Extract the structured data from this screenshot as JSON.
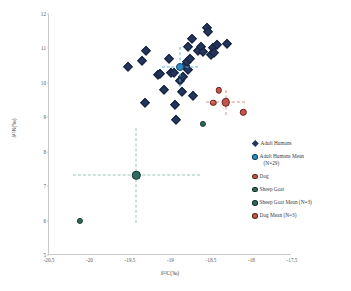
{
  "chart_data": {
    "type": "scatter",
    "title": "",
    "xlabel": "δ¹³C(‰)",
    "ylabel": "δ¹⁵N(‰)",
    "xlim": [
      -20.5,
      -17.5
    ],
    "ylim": [
      5,
      12
    ],
    "xticks": [
      "-20.5",
      "-20",
      "-19.5",
      "-19",
      "-18.5",
      "-18",
      "-17.5"
    ],
    "xtick_values": [
      -20.5,
      -20,
      -19.5,
      -19,
      -18.5,
      -18,
      -17.5
    ],
    "yticks": [
      "5",
      "6",
      "7",
      "8",
      "9",
      "10",
      "11",
      "12"
    ],
    "ytick_values": [
      5,
      6,
      7,
      8,
      9,
      10,
      11,
      12
    ],
    "grid": false,
    "legend_position": "right",
    "series": [
      {
        "name": "Adult Humans",
        "marker": "diamond",
        "color": "#23355c",
        "points": [
          [
            -19.53,
            10.45
          ],
          [
            -19.35,
            10.63
          ],
          [
            -19.3,
            10.92
          ],
          [
            -19.32,
            9.42
          ],
          [
            -19.16,
            10.22
          ],
          [
            -19.13,
            10.26
          ],
          [
            -19.08,
            9.8
          ],
          [
            -19.02,
            10.7
          ],
          [
            -18.99,
            10.3
          ],
          [
            -18.96,
            10.28
          ],
          [
            -18.95,
            9.36
          ],
          [
            -18.93,
            8.92
          ],
          [
            -18.88,
            10.05
          ],
          [
            -18.86,
            9.72
          ],
          [
            -18.84,
            10.18
          ],
          [
            -18.82,
            10.5
          ],
          [
            -18.8,
            10.62
          ],
          [
            -18.79,
            11.05
          ],
          [
            -18.78,
            10.38
          ],
          [
            -18.76,
            10.7
          ],
          [
            -18.74,
            11.26
          ],
          [
            -18.72,
            9.62
          ],
          [
            -18.66,
            10.93
          ],
          [
            -18.62,
            11.05
          ],
          [
            -18.6,
            10.9
          ],
          [
            -18.55,
            11.6
          ],
          [
            -18.54,
            11.48
          ],
          [
            -18.5,
            10.82
          ],
          [
            -18.48,
            11.02
          ],
          [
            -18.46,
            10.88
          ],
          [
            -18.42,
            11.1
          ],
          [
            -18.3,
            11.12
          ]
        ]
      },
      {
        "name": "Adult Humans Mean (N=29)",
        "marker": "circle",
        "color": "#2b8cc4",
        "points": [
          [
            -18.88,
            10.47
          ]
        ],
        "xerr": 0.22,
        "yerr": 0.58
      },
      {
        "name": "Dog",
        "marker": "circle",
        "color": "#c1574b",
        "points": [
          [
            -18.4,
            9.78
          ],
          [
            -18.47,
            9.42
          ],
          [
            -18.1,
            9.15
          ]
        ]
      },
      {
        "name": "Dog Mean (N=3)",
        "marker": "circle",
        "color": "#c1574b",
        "points": [
          [
            -18.32,
            9.43
          ]
        ],
        "xerr": 0.24,
        "yerr": 0.36
      },
      {
        "name": "Sheep Goat",
        "marker": "circle",
        "color": "#2e6b5e",
        "points": [
          [
            -18.6,
            8.8
          ],
          [
            -20.12,
            6.0
          ]
        ]
      },
      {
        "name": "Sheep Goat Mean (N=3)",
        "marker": "circle",
        "color": "#2e6b5e",
        "points": [
          [
            -19.42,
            7.32
          ]
        ],
        "xerr": 0.78,
        "yerr": 1.38
      }
    ]
  },
  "legend": {
    "items": [
      {
        "label": "Adult Humans",
        "marker": "diamond",
        "color": "#23355c"
      },
      {
        "label": "Adult Humans Mean",
        "label2": "(N=29)",
        "marker": "circle",
        "color": "#2b8cc4"
      },
      {
        "label": "Dog",
        "marker": "circle",
        "color": "#c1574b"
      },
      {
        "label": "Sheep Goat",
        "marker": "circle",
        "color": "#2e6b5e"
      },
      {
        "label": "Sheep Goat Mean (N=3)",
        "marker": "circle",
        "color": "#2e6b5e"
      },
      {
        "label": "Dog Mean (N=3)",
        "marker": "circle",
        "color": "#c1574b"
      }
    ]
  }
}
